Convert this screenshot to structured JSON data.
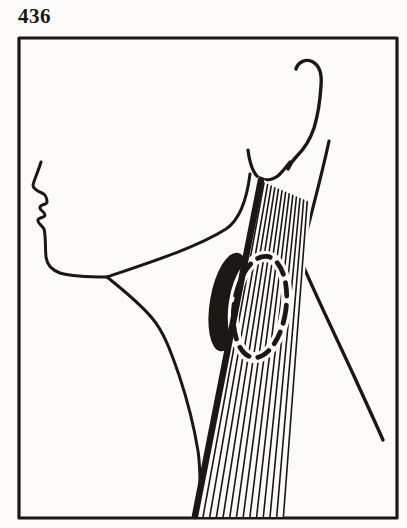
{
  "figure": {
    "number_label": "436",
    "ink_color": "#1b1814",
    "paper_color": "#fcfbf9"
  }
}
